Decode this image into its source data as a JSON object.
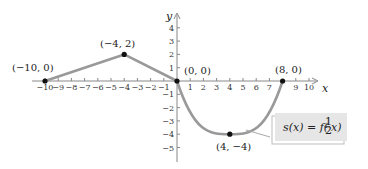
{
  "chart_data": {
    "type": "line",
    "title": "",
    "xlabel": "x",
    "ylabel": "y",
    "xlim": [
      -10,
      10
    ],
    "ylim": [
      -5,
      4
    ],
    "grid": false,
    "x_ticks": [
      -10,
      -9,
      -8,
      -7,
      -6,
      -5,
      -4,
      -3,
      -2,
      -1,
      1,
      2,
      3,
      4,
      5,
      6,
      7,
      9,
      10
    ],
    "x_tick_labels": [
      "−10",
      "−9",
      "−8",
      "−7",
      "−6",
      "−5",
      "−4",
      "−3",
      "−2",
      "−1",
      "1",
      "2",
      "3",
      "4",
      "5",
      "6",
      "7",
      "9",
      "10"
    ],
    "y_ticks": [
      4,
      3,
      2,
      1,
      -1,
      -2,
      -3,
      -4,
      -5
    ],
    "y_tick_labels": [
      "4",
      "3",
      "2",
      "1",
      "−1",
      "−2",
      "−3",
      "−4",
      "−5"
    ],
    "series": [
      {
        "name": "s(x) = f(½x)",
        "segments": [
          {
            "shape": "line",
            "points": [
              [
                -10,
                0
              ],
              [
                -4,
                2
              ]
            ]
          },
          {
            "shape": "line",
            "points": [
              [
                -4,
                2
              ],
              [
                0,
                0
              ]
            ]
          },
          {
            "shape": "curve",
            "points": [
              [
                0,
                0
              ],
              [
                4,
                -4
              ],
              [
                8,
                0
              ]
            ]
          }
        ],
        "color": "#999999"
      }
    ],
    "key_points": [
      {
        "x": -10,
        "y": 0,
        "label": "(−10, 0)"
      },
      {
        "x": -4,
        "y": 2,
        "label": "(−4, 2)"
      },
      {
        "x": 0,
        "y": 0,
        "label": "(0, 0)"
      },
      {
        "x": 4,
        "y": -4,
        "label": "(4, −4)"
      },
      {
        "x": 8,
        "y": 0,
        "label": "(8, 0)"
      }
    ],
    "annotations": [
      {
        "text": "s(x) = f(½x)",
        "box_color": "#e6e6e6"
      }
    ]
  },
  "labels": {
    "x_axis": "x",
    "y_axis": "y",
    "formula_main": "s(x) = f(",
    "formula_num": "1",
    "formula_den": "2",
    "formula_tail": "x)",
    "points": [
      "(−10, 0)",
      "(−4, 2)",
      "(0, 0)",
      "(4, −4)",
      "(8, 0)"
    ]
  },
  "colors": {
    "curve": "#999999",
    "axis": "#888888",
    "point": "#111111",
    "box_fill": "#e6e6e6",
    "box_shadow": "#bdbdbd"
  }
}
